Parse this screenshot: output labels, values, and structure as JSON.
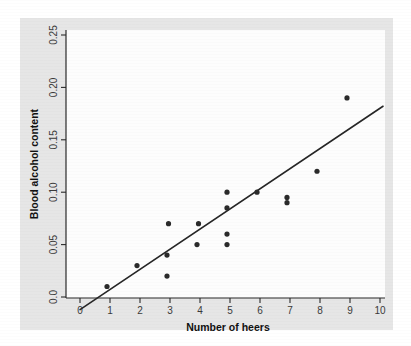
{
  "chart_data": {
    "type": "scatter",
    "title": "",
    "xlabel": "Number of heers",
    "ylabel": "Blood alcohol content",
    "xlim": [
      0,
      10.3
    ],
    "ylim": [
      -0.012,
      0.262
    ],
    "xticks": [
      0,
      1,
      2,
      3,
      4,
      5,
      6,
      7,
      8,
      9,
      10
    ],
    "xticklabels": [
      "0",
      "1",
      "2",
      "3",
      "4",
      "5",
      "6",
      "7",
      "8",
      "9",
      "10"
    ],
    "yticks": [
      0.0,
      0.05,
      0.1,
      0.15,
      0.2,
      0.25
    ],
    "yticklabels": [
      "0.0",
      "0.05",
      "0.10",
      "0.15",
      "0.20",
      "0.25"
    ],
    "grid": false,
    "legend": false,
    "series": [
      {
        "name": "Students",
        "marker": "filled-circle",
        "color": "#2b2b2b",
        "points": [
          {
            "x": 0.9,
            "y": 0.01
          },
          {
            "x": 1.9,
            "y": 0.03
          },
          {
            "x": 2.9,
            "y": 0.02
          },
          {
            "x": 2.9,
            "y": 0.04
          },
          {
            "x": 2.95,
            "y": 0.07
          },
          {
            "x": 3.9,
            "y": 0.05
          },
          {
            "x": 3.95,
            "y": 0.07
          },
          {
            "x": 4.9,
            "y": 0.05
          },
          {
            "x": 4.9,
            "y": 0.06
          },
          {
            "x": 4.9,
            "y": 0.085
          },
          {
            "x": 4.9,
            "y": 0.1
          },
          {
            "x": 5.9,
            "y": 0.1
          },
          {
            "x": 6.9,
            "y": 0.09
          },
          {
            "x": 6.9,
            "y": 0.095
          },
          {
            "x": 7.9,
            "y": 0.12
          },
          {
            "x": 8.9,
            "y": 0.19
          }
        ]
      }
    ],
    "fit_line": {
      "name": "least-squares regression line",
      "color": "#262626",
      "x_start": 0.0,
      "y_start": -0.012,
      "x_end": 10.1,
      "y_end": 0.182
    }
  },
  "axes": {
    "x_title": "Number of heers",
    "y_title": "Blood alcohol content"
  }
}
